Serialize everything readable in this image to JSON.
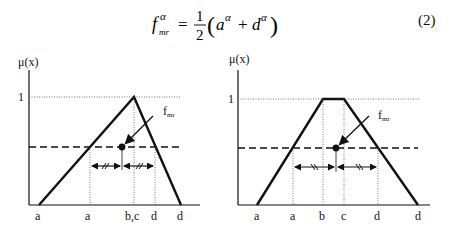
{
  "equation": {
    "lhs_main": "f",
    "lhs_sup": "α",
    "lhs_sub": "mr",
    "equals": "=",
    "frac_num": "1",
    "frac_den": "2",
    "open_paren": "(",
    "term1": "a",
    "term1_sup": "α",
    "plus": "+",
    "term2": "d",
    "term2_sup": "α",
    "close_paren": ")",
    "number": "(2)"
  },
  "colors": {
    "line": "#111111",
    "dotted": "#555555",
    "background": "#ffffff"
  },
  "diagrams": [
    {
      "id": "triangular",
      "y_axis_label": "μ(x)",
      "y_tick_label": "1",
      "point_label": "f",
      "point_label_sub": "mr",
      "x_labels": [
        "a",
        "a",
        "b,c",
        "d",
        "d"
      ],
      "shape": "triangle"
    },
    {
      "id": "trapezoidal",
      "y_axis_label": "μ(x)",
      "y_tick_label": "1",
      "point_label": "f",
      "point_label_sub": "mr",
      "x_labels": [
        "a",
        "a",
        "b",
        "c",
        "d",
        "d"
      ],
      "shape": "trapezoid"
    }
  ]
}
